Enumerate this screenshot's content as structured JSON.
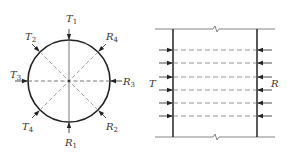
{
  "left_diagram": {
    "title": "circular cross-section with transmitter/receiver rays",
    "labels": {
      "T1": {
        "main": "T",
        "sub": "1"
      },
      "T2": {
        "main": "T",
        "sub": "2"
      },
      "T3": {
        "main": "T",
        "sub": "3"
      },
      "T4": {
        "main": "T",
        "sub": "4"
      },
      "R1": {
        "main": "R",
        "sub": "1"
      },
      "R2": {
        "main": "R",
        "sub": "2"
      },
      "R3": {
        "main": "R",
        "sub": "3"
      },
      "R4": {
        "main": "R",
        "sub": "4"
      }
    }
  },
  "right_diagram": {
    "title": "parallel rays through slab section",
    "labels": {
      "T": "T",
      "R": "R"
    },
    "ray_count": 6
  },
  "colors": {
    "stroke": "#333333",
    "dashed": "#555555",
    "background": "#ffffff"
  }
}
